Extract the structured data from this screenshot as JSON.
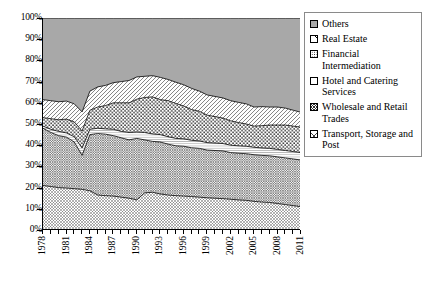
{
  "chart_data": {
    "type": "area",
    "stacked": "percent",
    "title": "",
    "xlabel": "",
    "ylabel": "",
    "ylim": [
      0,
      100
    ],
    "ytick_labels": [
      "0%",
      "10%",
      "20%",
      "30%",
      "40%",
      "50%",
      "60%",
      "70%",
      "80%",
      "90%",
      "100%"
    ],
    "ytick_values": [
      0,
      10,
      20,
      30,
      40,
      50,
      60,
      70,
      80,
      90,
      100
    ],
    "grid": false,
    "legend_position": "right",
    "x": [
      1978,
      1979,
      1980,
      1981,
      1982,
      1983,
      1984,
      1985,
      1986,
      1987,
      1988,
      1989,
      1990,
      1991,
      1992,
      1993,
      1994,
      1995,
      1996,
      1997,
      1998,
      1999,
      2000,
      2001,
      2002,
      2003,
      2004,
      2005,
      2006,
      2007,
      2008,
      2009,
      2010,
      2011
    ],
    "xtick_labels": [
      "1978",
      "1981",
      "1984",
      "1987",
      "1990",
      "1993",
      "1996",
      "1999",
      "2002",
      "2005",
      "2008",
      "2011"
    ],
    "xtick_values": [
      1978,
      1981,
      1984,
      1987,
      1990,
      1993,
      1996,
      1999,
      2002,
      2005,
      2008,
      2011
    ],
    "series": [
      {
        "name": "Transport, Storage and Post",
        "pattern": "fine-crosshatch",
        "values": [
          21.0,
          20.5,
          20.0,
          19.8,
          19.5,
          19.2,
          18.5,
          16.5,
          16.2,
          16.0,
          15.5,
          15.0,
          14.2,
          17.5,
          17.8,
          17.0,
          16.5,
          16.2,
          16.0,
          15.8,
          15.5,
          15.2,
          15.0,
          14.8,
          14.5,
          14.2,
          14.0,
          13.5,
          13.2,
          13.0,
          12.5,
          12.0,
          11.5,
          11.0
        ]
      },
      {
        "name": "Wholesale and Retail Trades",
        "pattern": "dense-crosshatch",
        "values": [
          27.0,
          25.5,
          24.5,
          24.0,
          22.0,
          16.0,
          26.5,
          29.0,
          29.0,
          28.5,
          28.0,
          27.5,
          29.0,
          25.0,
          24.0,
          24.5,
          24.0,
          23.5,
          23.5,
          23.0,
          23.0,
          22.5,
          22.5,
          22.5,
          22.0,
          22.0,
          22.0,
          22.0,
          22.0,
          22.0,
          22.0,
          22.0,
          22.0,
          22.0
        ]
      },
      {
        "name": "Hotel and Catering Services",
        "pattern": "horizontal-lines",
        "values": [
          1.0,
          1.5,
          2.0,
          2.0,
          2.5,
          3.5,
          2.5,
          2.5,
          2.5,
          3.0,
          3.0,
          3.5,
          3.0,
          3.5,
          3.5,
          3.5,
          3.5,
          3.5,
          3.5,
          3.5,
          3.5,
          3.5,
          3.5,
          3.5,
          3.5,
          3.5,
          3.5,
          3.5,
          3.5,
          3.5,
          3.5,
          3.5,
          3.5,
          3.5
        ]
      },
      {
        "name": "Financial Intermediation",
        "pattern": "dots",
        "values": [
          4.0,
          5.0,
          5.5,
          6.5,
          7.0,
          8.0,
          9.0,
          10.0,
          11.0,
          12.5,
          13.5,
          14.0,
          15.5,
          16.5,
          17.5,
          16.5,
          17.0,
          16.5,
          15.5,
          14.5,
          14.0,
          13.0,
          12.5,
          12.0,
          11.5,
          11.0,
          10.5,
          10.0,
          10.5,
          11.0,
          11.5,
          12.0,
          12.0,
          12.0
        ]
      },
      {
        "name": "Real Estate",
        "pattern": "diagonal-hatch",
        "values": [
          8.5,
          8.5,
          8.5,
          8.5,
          8.5,
          9.0,
          9.0,
          9.5,
          9.5,
          9.5,
          10.0,
          10.5,
          10.5,
          10.0,
          10.0,
          10.5,
          10.0,
          10.0,
          10.0,
          10.0,
          9.5,
          9.5,
          9.5,
          9.5,
          9.5,
          9.5,
          9.5,
          9.0,
          9.0,
          8.5,
          8.5,
          8.0,
          7.5,
          7.0
        ]
      },
      {
        "name": "Others",
        "pattern": "solid-gray",
        "values": [
          38.5,
          39.0,
          39.5,
          39.2,
          40.5,
          44.3,
          34.5,
          32.5,
          31.8,
          30.5,
          30.0,
          29.5,
          27.8,
          27.5,
          27.2,
          28.0,
          29.0,
          30.3,
          31.5,
          33.2,
          34.5,
          36.3,
          37.0,
          37.7,
          39.0,
          39.8,
          40.5,
          42.0,
          41.8,
          42.0,
          42.0,
          42.5,
          43.5,
          44.5
        ]
      }
    ]
  },
  "legend": {
    "items": [
      {
        "label": "Others",
        "swatch": "solid-gray-swatch"
      },
      {
        "label": "Real Estate",
        "swatch": "diagonal-hatch-swatch"
      },
      {
        "label": "Financial Intermediation",
        "swatch": "dots-swatch"
      },
      {
        "label": "Hotel and Catering Services",
        "swatch": "horizontal-lines-swatch"
      },
      {
        "label": "Wholesale and Retail Trades",
        "swatch": "dense-crosshatch-swatch"
      },
      {
        "label": "Transport, Storage and Post",
        "swatch": "fine-crosshatch-swatch"
      }
    ]
  },
  "colors": {
    "others_fill": "#a8a8a8",
    "line": "#000000",
    "background": "#ffffff",
    "legend_border": "#8a8a8a"
  }
}
